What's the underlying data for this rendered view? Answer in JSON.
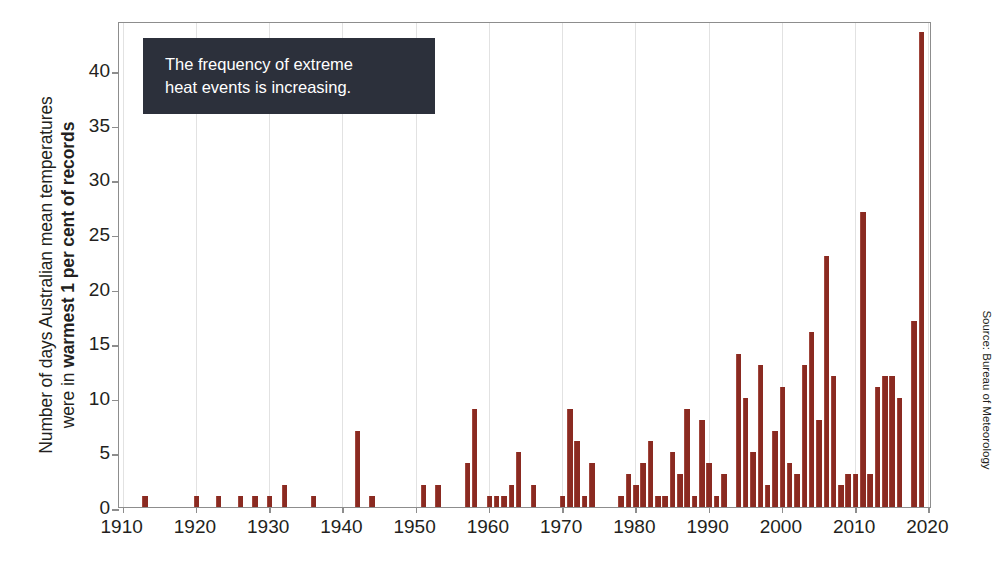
{
  "chart_data": {
    "type": "bar",
    "title": "",
    "subtitle": "",
    "xlabel": "",
    "ylabel_lines": [
      {
        "text": "Number of days Australian mean temperatures",
        "bold": false
      },
      {
        "text_plain": "were in ",
        "text_bold": "warmest 1 per cent of records",
        "bold": "partial"
      }
    ],
    "ylabel": "Number of days Australian mean temperatures were in warmest 1 per cent of records",
    "ylim": [
      0,
      44.5
    ],
    "yticks": [
      0,
      5,
      10,
      15,
      20,
      25,
      30,
      35,
      40
    ],
    "ytick_labels": [
      "0",
      "5",
      "10",
      "15",
      "20",
      "25",
      "30",
      "35",
      "40"
    ],
    "xlim": [
      1909.5,
      2020.5
    ],
    "xticks": [
      1910,
      1920,
      1930,
      1940,
      1950,
      1960,
      1970,
      1980,
      1990,
      2000,
      2010,
      2020
    ],
    "xtick_labels": [
      "1910",
      "1920",
      "1930",
      "1940",
      "1950",
      "1960",
      "1970",
      "1980",
      "1990",
      "2000",
      "2010",
      "2020"
    ],
    "grid": "vertical-only",
    "legend": "none",
    "bar_color": "#8a2a21",
    "frame_color": "#8d8d8d",
    "x": [
      1910,
      1911,
      1912,
      1913,
      1914,
      1915,
      1916,
      1917,
      1918,
      1919,
      1920,
      1921,
      1922,
      1923,
      1924,
      1925,
      1926,
      1927,
      1928,
      1929,
      1930,
      1931,
      1932,
      1933,
      1934,
      1935,
      1936,
      1937,
      1938,
      1939,
      1940,
      1941,
      1942,
      1943,
      1944,
      1945,
      1946,
      1947,
      1948,
      1949,
      1950,
      1951,
      1952,
      1953,
      1954,
      1955,
      1956,
      1957,
      1958,
      1959,
      1960,
      1961,
      1962,
      1963,
      1964,
      1965,
      1966,
      1967,
      1968,
      1969,
      1970,
      1971,
      1972,
      1973,
      1974,
      1975,
      1976,
      1977,
      1978,
      1979,
      1980,
      1981,
      1982,
      1983,
      1984,
      1985,
      1986,
      1987,
      1988,
      1989,
      1990,
      1991,
      1992,
      1993,
      1994,
      1995,
      1996,
      1997,
      1998,
      1999,
      2000,
      2001,
      2002,
      2003,
      2004,
      2005,
      2006,
      2007,
      2008,
      2009,
      2010,
      2011,
      2012,
      2013,
      2014,
      2015,
      2016,
      2017,
      2018,
      2019,
      2020
    ],
    "values": [
      0,
      0,
      0,
      1,
      0,
      0,
      0,
      0,
      0,
      0,
      1,
      0,
      0,
      1,
      0,
      0,
      1,
      0,
      1,
      0,
      1,
      0,
      2,
      0,
      0,
      0,
      1,
      0,
      0,
      0,
      0,
      0,
      7,
      0,
      1,
      0,
      0,
      0,
      0,
      0,
      0,
      2,
      0,
      2,
      0,
      0,
      0,
      4,
      9,
      0,
      1,
      1,
      1,
      2,
      5,
      0,
      2,
      0,
      0,
      0,
      1,
      9,
      6,
      1,
      4,
      0,
      0,
      0,
      1,
      3,
      2,
      4,
      6,
      1,
      1,
      5,
      3,
      9,
      1,
      8,
      4,
      1,
      3,
      0,
      14,
      10,
      5,
      13,
      2,
      7,
      11,
      4,
      3,
      13,
      16,
      8,
      23,
      12,
      2,
      3,
      3,
      27,
      3,
      11,
      12,
      12,
      10,
      0,
      17,
      43.5,
      0
    ],
    "annotations": [
      {
        "type": "callout-box",
        "lines": [
          "The frequency of extreme",
          "heat events is increasing."
        ],
        "background": "#2c303b",
        "text_color": "#ffffff"
      }
    ],
    "source": "Source: Bureau of Meteorology"
  },
  "ylabel": {
    "line1": "Number of days Australian mean temperatures",
    "line2_plain": "were in ",
    "line2_bold": "warmest 1 per cent of records"
  },
  "callout": {
    "line1": "The frequency of extreme",
    "line2": "heat events is increasing."
  },
  "source": {
    "text": "Source: Bureau of Meteorology"
  }
}
